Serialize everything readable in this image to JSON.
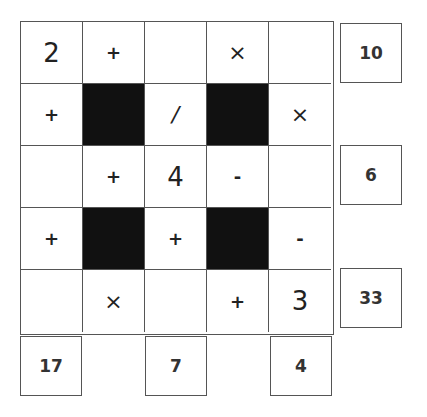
{
  "puzzle": {
    "grid": [
      [
        {
          "t": "num",
          "v": "2"
        },
        {
          "t": "op",
          "v": "+"
        },
        {
          "t": "empty",
          "v": ""
        },
        {
          "t": "op",
          "v": "×"
        },
        {
          "t": "empty",
          "v": ""
        }
      ],
      [
        {
          "t": "op",
          "v": "+"
        },
        {
          "t": "black",
          "v": ""
        },
        {
          "t": "op",
          "v": "/"
        },
        {
          "t": "black",
          "v": ""
        },
        {
          "t": "op",
          "v": "×"
        }
      ],
      [
        {
          "t": "empty",
          "v": ""
        },
        {
          "t": "op",
          "v": "+"
        },
        {
          "t": "num",
          "v": "4"
        },
        {
          "t": "op",
          "v": "-"
        },
        {
          "t": "empty",
          "v": ""
        }
      ],
      [
        {
          "t": "op",
          "v": "+"
        },
        {
          "t": "black",
          "v": ""
        },
        {
          "t": "op",
          "v": "+"
        },
        {
          "t": "black",
          "v": ""
        },
        {
          "t": "op",
          "v": "-"
        }
      ],
      [
        {
          "t": "empty",
          "v": ""
        },
        {
          "t": "op",
          "v": "×"
        },
        {
          "t": "empty",
          "v": ""
        },
        {
          "t": "op",
          "v": "+"
        },
        {
          "t": "num",
          "v": "3"
        }
      ]
    ],
    "row_clues": [
      {
        "row": 0,
        "value": "10"
      },
      {
        "row": 2,
        "value": "6"
      },
      {
        "row": 4,
        "value": "33"
      }
    ],
    "col_clues": [
      {
        "col": 0,
        "value": "17"
      },
      {
        "col": 2,
        "value": "7"
      },
      {
        "col": 4,
        "value": "4"
      }
    ]
  }
}
